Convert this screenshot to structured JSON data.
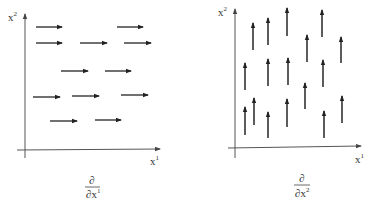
{
  "diagrams": [
    {
      "name": "partial-x1-field",
      "y_axis_label": {
        "base": "x",
        "sup": "2"
      },
      "x_axis_label": {
        "base": "x",
        "sup": "1"
      },
      "caption": {
        "numerator": "∂",
        "denominator_base": "∂x",
        "denominator_sup": "1"
      },
      "vector_direction": "horizontal-right",
      "arrow_count": 12
    },
    {
      "name": "partial-x2-field",
      "y_axis_label": {
        "base": "x",
        "sup": "2"
      },
      "x_axis_label": {
        "base": "x",
        "sup": "1"
      },
      "caption": {
        "numerator": "∂",
        "denominator_base": "∂x",
        "denominator_sup": "2"
      },
      "vector_direction": "vertical-up",
      "arrow_count": 17
    }
  ],
  "colors": {
    "axis": "#555555",
    "arrow": "#222222",
    "text": "#333333",
    "background": "#ffffff"
  }
}
